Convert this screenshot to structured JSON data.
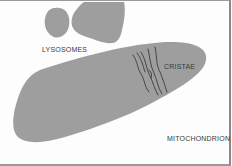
{
  "diagram": {
    "colors": {
      "organelle_fill": "#9e9e9e",
      "cristae_stroke": "#3c3c3c",
      "label_text": "#3a3a3a",
      "background": "#ffffff"
    },
    "labels": {
      "lysosomes": "LYSOSOMES",
      "cristae": "CRISTAE",
      "mitochondrion": "MITOCHONDRION"
    }
  }
}
